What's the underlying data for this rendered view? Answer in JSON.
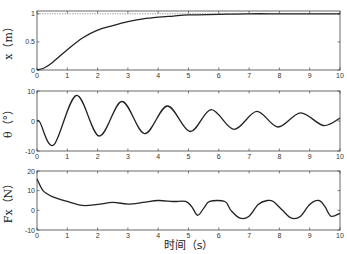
{
  "chart_data": [
    {
      "type": "line",
      "title": "",
      "xlabel": "",
      "ylabel": "x（m）",
      "xlim": [
        0,
        10
      ],
      "ylim": [
        0,
        1.05
      ],
      "xticks": [
        0,
        1,
        2,
        3,
        4,
        5,
        6,
        7,
        8,
        9,
        10
      ],
      "yticks": [
        0,
        0.5,
        1
      ],
      "ytick_labels": [
        "0",
        "0.5",
        "1"
      ],
      "grid": false,
      "reference_line": {
        "y": 1,
        "style": "dashed"
      },
      "series": [
        {
          "name": "x",
          "x": [
            0,
            0.25,
            0.5,
            1,
            1.5,
            2,
            2.5,
            3,
            3.5,
            4,
            4.5,
            5,
            6,
            7,
            8,
            9,
            10
          ],
          "values": [
            0,
            0.04,
            0.13,
            0.36,
            0.57,
            0.71,
            0.79,
            0.86,
            0.91,
            0.94,
            0.96,
            0.98,
            0.99,
            1.0,
            1.0,
            1.0,
            1.0
          ]
        }
      ]
    },
    {
      "type": "line",
      "title": "",
      "xlabel": "",
      "ylabel": "θ（°）",
      "xlim": [
        0,
        10
      ],
      "ylim": [
        -10,
        10
      ],
      "xticks": [
        0,
        1,
        2,
        3,
        4,
        5,
        6,
        7,
        8,
        9,
        10
      ],
      "yticks": [
        -10,
        0,
        10
      ],
      "grid": false,
      "series": [
        {
          "name": "theta",
          "x": [
            0,
            0.1,
            0.55,
            1.3,
            2.05,
            2.8,
            3.55,
            4.3,
            5.05,
            5.75,
            6.5,
            7.25,
            7.95,
            8.7,
            9.45,
            10
          ],
          "values": [
            0,
            -0.5,
            -8,
            8.5,
            -5,
            6.5,
            -4.2,
            5,
            -3.5,
            3.8,
            -2.8,
            3.2,
            -2,
            2.7,
            -1.5,
            1
          ]
        }
      ]
    },
    {
      "type": "line",
      "title": "",
      "xlabel": "时间（s）",
      "ylabel": "Fx（N）",
      "xlim": [
        0,
        10
      ],
      "ylim": [
        -10,
        20
      ],
      "xticks": [
        0,
        1,
        2,
        3,
        4,
        5,
        6,
        7,
        8,
        9,
        10
      ],
      "yticks": [
        -10,
        0,
        10,
        20
      ],
      "grid": false,
      "series": [
        {
          "name": "Fx",
          "x": [
            0,
            0.2,
            0.5,
            1,
            1.5,
            2,
            2.5,
            3,
            3.5,
            4,
            4.5,
            4.9,
            5.1,
            5.3,
            5.5,
            5.7,
            6.2,
            6.4,
            6.7,
            7.0,
            7.3,
            7.6,
            7.8,
            8.1,
            8.4,
            8.7,
            9.0,
            9.3,
            9.5,
            9.7,
            10
          ],
          "values": [
            16,
            10,
            7,
            4.5,
            2.5,
            3,
            4,
            3.2,
            4,
            5,
            4.5,
            4.5,
            2,
            -2.5,
            1,
            4.5,
            4.5,
            0,
            -4,
            -3,
            3,
            5,
            4.5,
            0,
            -4,
            -3,
            3,
            5,
            2,
            -3,
            -1.5
          ]
        }
      ]
    }
  ],
  "panels": [
    {
      "ylabel": "x（m）",
      "yticks": [
        "1",
        "0.5",
        "0"
      ]
    },
    {
      "ylabel": "θ（°）",
      "yticks": [
        "10",
        "0",
        "-10"
      ]
    },
    {
      "ylabel": "Fx（N）",
      "yticks": [
        "20",
        "10",
        "0",
        "-10"
      ]
    }
  ],
  "xtick_labels": [
    "0",
    "1",
    "2",
    "3",
    "4",
    "5",
    "6",
    "7",
    "8",
    "9",
    "10"
  ],
  "xlabel": "时间（s）"
}
